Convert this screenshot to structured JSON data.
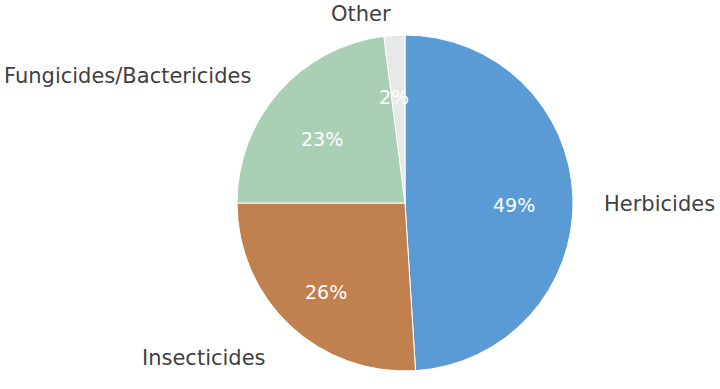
{
  "chart_data": {
    "type": "pie",
    "title": "",
    "subtitle": "",
    "xlabel": "",
    "ylabel": "",
    "legend_position": "none",
    "grid": false,
    "start_angle_deg": 90,
    "direction": "clockwise",
    "unit": "percent",
    "categories": [
      "Herbicides",
      "Insecticides",
      "Fungicides/Bactericides",
      "Other"
    ],
    "values": [
      49,
      26,
      23,
      2
    ],
    "value_labels": [
      "49%",
      "26%",
      "23%",
      "2%"
    ],
    "colors": [
      "#5b9bd5",
      "#c0814f",
      "#a9cfb4",
      "#e7e8e8"
    ],
    "slices": [
      {
        "name": "Herbicides",
        "value": 49,
        "value_label": "49%",
        "color": "#5b9bd5",
        "label_color": "#3f3f3f",
        "value_label_color": "#ffffff"
      },
      {
        "name": "Insecticides",
        "value": 26,
        "value_label": "26%",
        "color": "#c0814f",
        "label_color": "#3f3f3f",
        "value_label_color": "#ffffff"
      },
      {
        "name": "Fungicides/Bactericides",
        "value": 23,
        "value_label": "23%",
        "color": "#a9cfb4",
        "label_color": "#3f3f3f",
        "value_label_color": "#ffffff"
      },
      {
        "name": "Other",
        "value": 2,
        "value_label": "2%",
        "color": "#e7e8e8",
        "label_color": "#3f3f3f",
        "value_label_color": "#ffffff"
      }
    ]
  },
  "labels": {
    "other": "Other",
    "fungicides_bactericides": "Fungicides/Bactericides",
    "herbicides": "Herbicides",
    "insecticides": "Insecticides"
  },
  "percent_labels": {
    "other": "2%",
    "fungicides_bactericides": "23%",
    "herbicides": "49%",
    "insecticides": "26%"
  },
  "geometry": {
    "center_x": 405,
    "center_y": 203,
    "radius": 168
  },
  "background_color": "#ffffff"
}
